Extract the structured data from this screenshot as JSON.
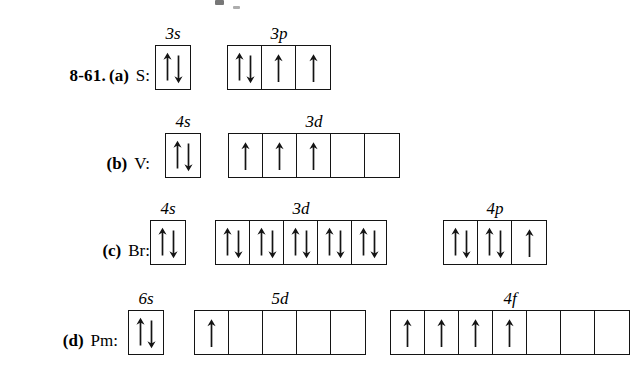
{
  "figure": {
    "problem_number": "8-61.",
    "ink_color": "#141414",
    "background_color": "#ffffff"
  },
  "rows": [
    {
      "part": "(a)",
      "species": "S:",
      "groups": [
        {
          "label": "3s",
          "box_count": 1,
          "occupancy": [
            "pair"
          ]
        },
        {
          "label": "3p",
          "box_count": 3,
          "occupancy": [
            "pair",
            "up",
            "up"
          ]
        }
      ]
    },
    {
      "part": "(b)",
      "species": "V:",
      "groups": [
        {
          "label": "4s",
          "box_count": 1,
          "occupancy": [
            "pair"
          ]
        },
        {
          "label": "3d",
          "box_count": 5,
          "occupancy": [
            "up",
            "up",
            "up",
            "empty",
            "empty"
          ]
        }
      ]
    },
    {
      "part": "(c)",
      "species": "Br:",
      "groups": [
        {
          "label": "4s",
          "box_count": 1,
          "occupancy": [
            "pair"
          ]
        },
        {
          "label": "3d",
          "box_count": 5,
          "occupancy": [
            "pair",
            "pair",
            "pair",
            "pair",
            "pair"
          ]
        },
        {
          "label": "4p",
          "box_count": 3,
          "occupancy": [
            "pair",
            "pair",
            "up"
          ]
        }
      ]
    },
    {
      "part": "(d)",
      "species": "Pm:",
      "groups": [
        {
          "label": "6s",
          "box_count": 1,
          "occupancy": [
            "pair"
          ]
        },
        {
          "label": "5d",
          "box_count": 5,
          "occupancy": [
            "up",
            "empty",
            "empty",
            "empty",
            "empty"
          ]
        },
        {
          "label": "4f",
          "box_count": 7,
          "occupancy": [
            "up",
            "up",
            "up",
            "up",
            "empty",
            "empty",
            "empty"
          ]
        }
      ]
    }
  ],
  "layout": {
    "row_tops": [
      0,
      88,
      175,
      265
    ],
    "label_rights": [
      150,
      150,
      150,
      118
    ],
    "group_lefts": [
      [
        155,
        227
      ],
      [
        165,
        228
      ],
      [
        150,
        215,
        443
      ],
      [
        128,
        194,
        390
      ]
    ]
  }
}
